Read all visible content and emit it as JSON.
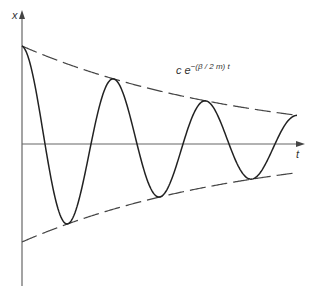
{
  "labels": {
    "y_axis": "x",
    "x_axis": "t",
    "envelope_prefix": "c e",
    "envelope_exponent": "−(β / 2 m) t"
  },
  "chart_data": {
    "type": "line",
    "title": "",
    "xlabel": "t",
    "ylabel": "x",
    "series": [
      {
        "name": "damped oscillation",
        "style": "solid",
        "equation": "x = c e^{-(β/2m)t} cos(ωt)"
      },
      {
        "name": "upper envelope",
        "style": "dashed",
        "equation": "c e^{-(β/2m)t}"
      },
      {
        "name": "lower envelope",
        "style": "dashed",
        "equation": "-c e^{-(β/2m)t}"
      }
    ],
    "annotation": "c e^{-(β/2m)t}",
    "grid": false
  },
  "colors": {
    "curve": "#222222",
    "axis": "#555555",
    "envelope": "#444444"
  }
}
